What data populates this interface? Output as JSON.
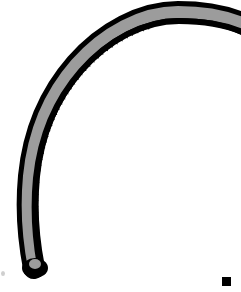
{
  "figure": {
    "title": "Serrated arched band specimen illustration",
    "orientation": "arch opening downward-right; free tip at bottom-left",
    "canvas": {
      "width": 241,
      "height": 292,
      "background_color": "#ffffff"
    },
    "colors": {
      "outline": "#000000",
      "band_fill": "#9c9c9c",
      "tooth_strip": "#000000",
      "background": "#ffffff"
    },
    "geometry": {
      "band_total_thickness_px": 19,
      "outline_stroke_px": 5,
      "gray_band_thickness_px": 9,
      "tooth_strip_thickness_px": 5,
      "tooth_count": 48,
      "tooth_pitch_px": 6,
      "tooth_length_px": 4,
      "apex_y_px": 6,
      "tip_x_px": 30,
      "tip_y_px": 272
    },
    "marks": {
      "bottom_right": "solid black square fragment at lower-right corner",
      "bottom_left": "faint small gray speck near lower-left edge"
    }
  }
}
